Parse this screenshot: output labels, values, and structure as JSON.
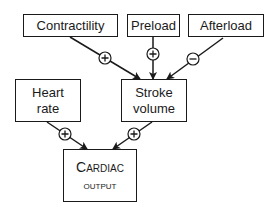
{
  "diagram": {
    "nodes": {
      "contractility": {
        "label": "Contractility"
      },
      "preload": {
        "label": "Preload"
      },
      "afterload": {
        "label": "Afterload"
      },
      "heart_rate": {
        "line1": "Heart",
        "line2": "rate"
      },
      "stroke_volume": {
        "line1": "Stroke",
        "line2": "volume"
      },
      "cardiac_output": {
        "line1": "Cardiac",
        "line2": "output"
      }
    },
    "edges": [
      {
        "from": "Contractility",
        "to": "Stroke volume",
        "sign": "+"
      },
      {
        "from": "Preload",
        "to": "Stroke volume",
        "sign": "+"
      },
      {
        "from": "Afterload",
        "to": "Stroke volume",
        "sign": "−"
      },
      {
        "from": "Heart rate",
        "to": "Cardiac output",
        "sign": "+"
      },
      {
        "from": "Stroke volume",
        "to": "Cardiac output",
        "sign": "+"
      }
    ]
  }
}
